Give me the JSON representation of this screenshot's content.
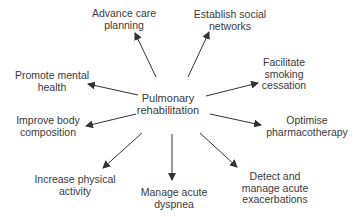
{
  "center": {
    "line1": "Pulmonary",
    "line2": "rehabilitation"
  },
  "nodes": [
    {
      "id": "advance-care-planning",
      "line1": "Advance care",
      "line2": "planning"
    },
    {
      "id": "establish-social-networks",
      "line1": "Establish social",
      "line2": "networks"
    },
    {
      "id": "promote-mental-health",
      "line1": "Promote mental",
      "line2": "health"
    },
    {
      "id": "facilitate-smoking-cessation",
      "line1": "Facilitate",
      "line2": "smoking",
      "line3": "cessation"
    },
    {
      "id": "improve-body-composition",
      "line1": "Improve body",
      "line2": "composition"
    },
    {
      "id": "optimise-pharmacotherapy",
      "line1": "Optimise",
      "line2": "pharmacotherapy"
    },
    {
      "id": "increase-physical-activity",
      "line1": "Increase physical",
      "line2": "activity"
    },
    {
      "id": "manage-acute-dyspnea",
      "line1": "Manage acute",
      "line2": "dyspnea"
    },
    {
      "id": "detect-manage-exacerbations",
      "line1": "Detect and",
      "line2": "manage acute",
      "line3": "exacerbations"
    }
  ],
  "colors": {
    "text": "#3a3a3a",
    "arrow": "#333333",
    "background": "#ffffff"
  }
}
